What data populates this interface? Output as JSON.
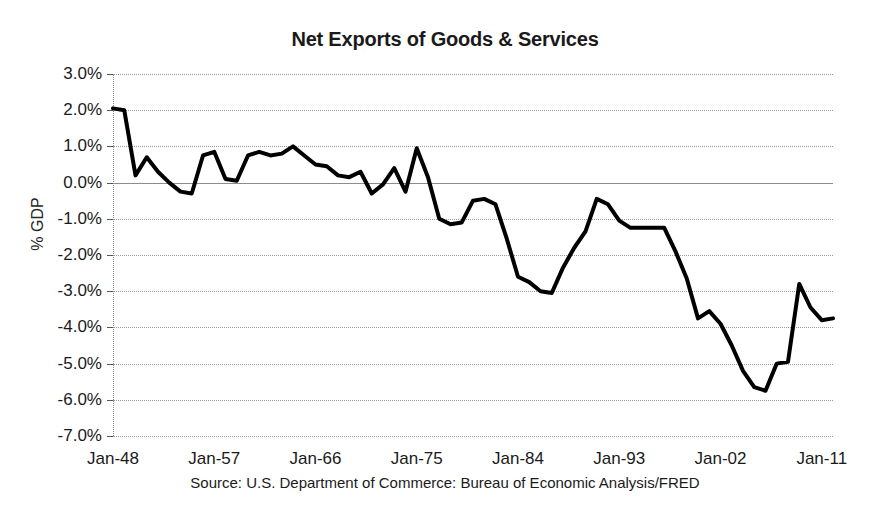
{
  "chart_data": {
    "type": "line",
    "title": "Net Exports of Goods & Services",
    "xlabel": "",
    "ylabel": "% GDP",
    "source_note": "Source: U.S. Department of Commerce: Bureau of Economic Analysis/FRED",
    "grid": true,
    "legend": "none",
    "line_color": "#000000",
    "line_width": 4,
    "ylim": [
      -7.0,
      3.0
    ],
    "ytick_labels": [
      "3.0%",
      "2.0%",
      "1.0%",
      "0.0%",
      "-1.0%",
      "-2.0%",
      "-3.0%",
      "-4.0%",
      "-5.0%",
      "-6.0%",
      "-7.0%"
    ],
    "ytick_values": [
      3.0,
      2.0,
      1.0,
      0.0,
      -1.0,
      -2.0,
      -3.0,
      -4.0,
      -5.0,
      -6.0,
      -7.0
    ],
    "xtick_labels": [
      "Jan-48",
      "Jan-57",
      "Jan-66",
      "Jan-75",
      "Jan-84",
      "Jan-93",
      "Jan-02",
      "Jan-11"
    ],
    "xtick_values": [
      1948,
      1957,
      1966,
      1975,
      1984,
      1993,
      2002,
      2011
    ],
    "xlim": [
      1948,
      2012
    ],
    "x": [
      1948,
      1949,
      1950,
      1951,
      1952,
      1953,
      1954,
      1955,
      1956,
      1957,
      1958,
      1959,
      1960,
      1961,
      1962,
      1963,
      1964,
      1965,
      1966,
      1967,
      1968,
      1969,
      1970,
      1971,
      1972,
      1973,
      1974,
      1975,
      1976,
      1977,
      1978,
      1979,
      1980,
      1981,
      1982,
      1983,
      1984,
      1985,
      1986,
      1987,
      1988,
      1989,
      1990,
      1991,
      1992,
      1993,
      1994,
      1995,
      1996,
      1997,
      1998,
      1999,
      2000,
      2001,
      2002,
      2003,
      2004,
      2005,
      2006,
      2007,
      2008,
      2009,
      2010,
      2011,
      2012
    ],
    "values": [
      2.05,
      2.0,
      0.2,
      0.7,
      0.3,
      0.0,
      -0.25,
      -0.3,
      0.75,
      0.85,
      0.1,
      0.05,
      0.75,
      0.85,
      0.75,
      0.8,
      1.0,
      0.75,
      0.5,
      0.45,
      0.2,
      0.15,
      0.3,
      -0.3,
      -0.05,
      0.4,
      -0.25,
      0.95,
      0.15,
      -1.0,
      -1.15,
      -1.1,
      -0.5,
      -0.45,
      -0.6,
      -1.55,
      -2.6,
      -2.75,
      -3.0,
      -3.05,
      -2.35,
      -1.8,
      -1.35,
      -0.45,
      -0.6,
      -1.05,
      -1.25,
      -1.25,
      -1.25,
      -1.25,
      -1.9,
      -2.65,
      -3.75,
      -3.55,
      -3.9,
      -4.5,
      -5.2,
      -5.65,
      -5.75,
      -5.0,
      -4.95,
      -2.8,
      -3.45,
      -3.8,
      -3.75
    ]
  }
}
